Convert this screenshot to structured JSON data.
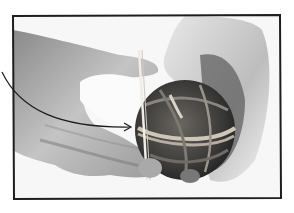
{
  "image": {
    "subject": "hands holding a rubber band ball",
    "annotation": "arrow pointing to rubber band wrapped around ball",
    "colors": {
      "background": "#ffffff",
      "frame": "#1e1e1e",
      "arrow": "#1a1a1a",
      "skin_light": "#d9d9d9",
      "skin_mid": "#a8a8a8",
      "skin_dark": "#6e6e6e",
      "ball_dark": "#3a3a3a",
      "band_light": "#cfc6b8"
    }
  }
}
